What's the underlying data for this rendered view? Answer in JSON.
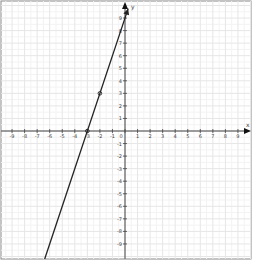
{
  "chart_data": {
    "type": "line",
    "title": "",
    "xlabel": "x",
    "ylabel": "y",
    "xlim": [
      -10,
      10
    ],
    "ylim": [
      -10,
      10
    ],
    "grid": true,
    "minor_grid": true,
    "x_ticks": [
      -9,
      -8,
      -7,
      -6,
      -5,
      -4,
      -3,
      -2,
      -1,
      0,
      1,
      2,
      3,
      4,
      5,
      6,
      7,
      8,
      9
    ],
    "y_ticks": [
      -9,
      -8,
      -7,
      -6,
      -5,
      -4,
      -3,
      -2,
      -1,
      1,
      2,
      3,
      4,
      5,
      6,
      7,
      8,
      9
    ],
    "series": [
      {
        "name": "y = 3x + 9",
        "equation": {
          "slope": 3,
          "intercept": 9
        },
        "x": [
          -6.4,
          0.25
        ],
        "y": [
          -10.2,
          9.75
        ],
        "color": "#222222"
      }
    ],
    "marked_points": [
      {
        "x": -2,
        "y": 3
      },
      {
        "x": -3,
        "y": 0
      }
    ]
  },
  "colors": {
    "background": "#ffffff",
    "border": "#888888",
    "grid_major": "#e6e6e6",
    "grid_minor": "#f3f3f3",
    "axis": "#444444",
    "line": "#222222"
  }
}
